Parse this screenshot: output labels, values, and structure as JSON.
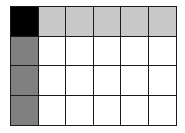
{
  "grid": {
    "rows": 4,
    "cols": 6,
    "colors": {
      "corner": "#000000",
      "header_row": "#c8c8c8",
      "header_col": "#808080",
      "body": "#ffffff"
    },
    "cells": [
      [
        "corner",
        "header_row",
        "header_row",
        "header_row",
        "header_row",
        "header_row"
      ],
      [
        "header_col",
        "body",
        "body",
        "body",
        "body",
        "body"
      ],
      [
        "header_col",
        "body",
        "body",
        "body",
        "body",
        "body"
      ],
      [
        "header_col",
        "body",
        "body",
        "body",
        "body",
        "body"
      ]
    ]
  }
}
